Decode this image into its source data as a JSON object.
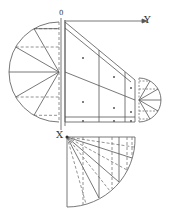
{
  "diagram": {
    "type": "descriptive-geometry projection / development drawing",
    "labels": {
      "origin": "0",
      "y_axis": "Y",
      "x_axis": "X"
    },
    "colors": {
      "line": "#555555",
      "dashed": "#777777",
      "background": "#ffffff"
    },
    "parts": [
      {
        "name": "large left semicircle",
        "center": [
          59,
          72
        ],
        "radius": 50,
        "divisions": 12
      },
      {
        "name": "central trapezoid (truncated cone view)",
        "corners": [
          [
            64,
            22
          ],
          [
            135,
            80
          ],
          [
            135,
            122
          ],
          [
            64,
            122
          ]
        ]
      },
      {
        "name": "small right semicircle",
        "center": [
          139,
          100
        ],
        "radius": 22,
        "divisions": 12
      },
      {
        "name": "bottom quarter-circle development",
        "center": [
          67,
          137
        ],
        "radius": 70,
        "divisions": 12
      }
    ]
  }
}
